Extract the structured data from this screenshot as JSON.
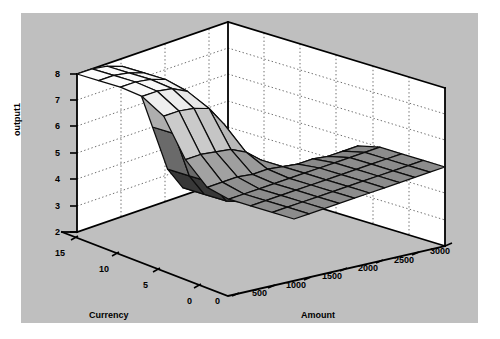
{
  "figure": {
    "background": "#bfbfbf",
    "page_background": "#ffffff",
    "axis_line_color": "#000000",
    "grid_color": "#808080",
    "mesh_line_color": "#000000"
  },
  "axes": {
    "z": {
      "title": "output1",
      "ticks": [
        "8",
        "7",
        "6",
        "5",
        "4",
        "3",
        "2"
      ],
      "values": [
        8,
        7,
        6,
        5,
        4,
        3,
        2
      ],
      "min": 2,
      "max": 8
    },
    "x_left": {
      "title": "Currency",
      "ticks": [
        "15",
        "10",
        "5",
        "0"
      ],
      "values": [
        15,
        10,
        5,
        0
      ],
      "min": 0,
      "max": 17
    },
    "x_right": {
      "title": "Amount",
      "ticks": [
        "0",
        "500",
        "1000",
        "1500",
        "2000",
        "2500",
        "3000"
      ],
      "values": [
        0,
        500,
        1000,
        1500,
        2000,
        2500,
        3000
      ],
      "min": 0,
      "max": 3000
    },
    "origin_tick": "0"
  },
  "chart_data": {
    "type": "surface",
    "title": "",
    "xlabel": "Currency",
    "ylabel": "Amount",
    "zlabel": "output1",
    "xlim": [
      0,
      17
    ],
    "ylim": [
      0,
      3000
    ],
    "zlim": [
      2,
      8
    ],
    "grid": true,
    "legend": false,
    "colormap": "gray",
    "x": [
      0,
      1.7,
      3.4,
      5.1,
      6.8,
      8.5,
      10.2,
      11.9,
      13.6,
      15.3,
      17
    ],
    "y": [
      0,
      300,
      600,
      900,
      1200,
      1500,
      1800,
      2100,
      2400,
      2700,
      3000
    ],
    "z": [
      [
        2.0,
        2.0,
        2.1,
        2.3,
        3.2,
        5.0,
        6.8,
        7.7,
        7.9,
        8.0,
        8.0
      ],
      [
        2.0,
        2.0,
        2.1,
        2.3,
        3.2,
        5.0,
        6.8,
        7.7,
        7.9,
        8.0,
        8.0
      ],
      [
        2.0,
        2.0,
        2.1,
        2.3,
        3.2,
        5.0,
        6.8,
        7.7,
        7.9,
        8.0,
        8.0
      ],
      [
        2.1,
        2.1,
        2.2,
        2.5,
        3.4,
        5.0,
        6.6,
        7.5,
        7.8,
        7.9,
        7.9
      ],
      [
        2.6,
        2.6,
        2.7,
        2.9,
        3.7,
        5.0,
        6.3,
        7.1,
        7.3,
        7.4,
        7.4
      ],
      [
        4.0,
        4.0,
        4.1,
        4.2,
        4.5,
        5.0,
        5.5,
        5.8,
        5.9,
        6.0,
        6.0
      ],
      [
        4.8,
        4.8,
        4.8,
        4.9,
        4.9,
        5.0,
        5.1,
        5.1,
        5.2,
        5.2,
        5.2
      ],
      [
        5.0,
        5.0,
        5.0,
        5.0,
        5.0,
        5.0,
        5.0,
        5.0,
        5.0,
        5.0,
        5.0
      ],
      [
        5.0,
        5.0,
        5.0,
        5.0,
        5.0,
        5.0,
        5.0,
        5.0,
        5.0,
        5.0,
        5.0
      ],
      [
        5.0,
        5.0,
        5.0,
        5.0,
        5.0,
        5.0,
        5.0,
        5.0,
        5.0,
        5.0,
        5.0
      ],
      [
        5.0,
        5.0,
        5.0,
        5.0,
        5.0,
        5.0,
        5.0,
        5.0,
        5.0,
        5.0,
        5.0
      ]
    ]
  },
  "geometry": {
    "note": "Projected pixel coordinates of the axis box corners in the 500x339 image.",
    "box": {
      "back_left_top": [
        77,
        74
      ],
      "back_left_bottom": [
        77,
        232
      ],
      "back_top_apex": [
        228,
        22
      ],
      "back_right_top": [
        445,
        88
      ],
      "back_right_bottom": [
        445,
        246
      ],
      "front_bottom_apex": [
        228,
        296
      ]
    }
  }
}
